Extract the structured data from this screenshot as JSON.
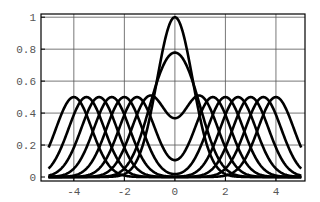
{
  "chart_data": {
    "type": "line",
    "title": "",
    "xlabel": "",
    "ylabel": "",
    "xlim": [
      -5.3,
      5.15
    ],
    "ylim": [
      -0.025,
      1.02
    ],
    "grid": true,
    "legend": null,
    "x_ticks": [
      -4,
      -2,
      0,
      2,
      4
    ],
    "x_tick_labels": [
      "-4",
      "-2",
      "0",
      "2",
      "4"
    ],
    "y_ticks": [
      0,
      0.2,
      0.4,
      0.6,
      0.8,
      1
    ],
    "y_tick_labels": [
      "0",
      "0.2",
      "0.4",
      "0.6",
      "0.8",
      "1"
    ],
    "function": "f(x) = 0.5*exp(-(x-a)^2) + 0.5*exp(-(x+a)^2)",
    "x_domain": [
      -5,
      5
    ],
    "series": [
      {
        "name": "a=0",
        "a": 0,
        "peak_value": 1.0
      },
      {
        "name": "a=0.5",
        "a": 0.5,
        "peak_value": 0.78
      },
      {
        "name": "a=1",
        "a": 1,
        "center_value": 0.37
      },
      {
        "name": "a=1.5",
        "a": 1.5,
        "center_value": 0.105
      },
      {
        "name": "a=2",
        "a": 2,
        "peak_value": 0.5
      },
      {
        "name": "a=2.5",
        "a": 2.5,
        "peak_value": 0.5
      },
      {
        "name": "a=3",
        "a": 3,
        "peak_value": 0.5
      },
      {
        "name": "a=3.5",
        "a": 3.5,
        "peak_value": 0.5
      },
      {
        "name": "a=4",
        "a": 4,
        "peak_value": 0.5
      }
    ],
    "colors": {
      "line": "#000000",
      "grid": "#555555",
      "frame": "#000000",
      "tick_text": "#555555"
    }
  }
}
